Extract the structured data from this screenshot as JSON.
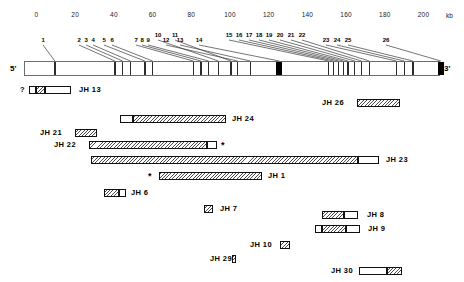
{
  "figure": {
    "unit_label": "kb",
    "five_prime_label": "5'",
    "three_prime_label": "3'"
  },
  "scale": {
    "ticks": [
      0,
      20,
      40,
      60,
      80,
      100,
      120,
      140,
      160,
      180,
      200
    ],
    "min_kb": 0,
    "max_kb": 200,
    "unit": "kb"
  },
  "exons": [
    {
      "id": "1",
      "label": "1",
      "kb": 9.5,
      "type": "line"
    },
    {
      "id": "2",
      "label": "2",
      "kb": 40.5,
      "type": "line"
    },
    {
      "id": "3",
      "label": "3",
      "kb": 44.5,
      "type": "line"
    },
    {
      "id": "4",
      "label": "4",
      "kb": 48.5,
      "type": "line"
    },
    {
      "id": "5",
      "label": "5",
      "kb": 56.0,
      "type": "line"
    },
    {
      "id": "6",
      "label": "6",
      "kb": 60.0,
      "type": "line"
    },
    {
      "id": "7",
      "label": "7",
      "kb": 81.0,
      "type": "line"
    },
    {
      "id": "8",
      "label": "8",
      "kb": 85.0,
      "type": "line"
    },
    {
      "id": "9",
      "label": "9",
      "kb": 89.0,
      "type": "line"
    },
    {
      "id": "10",
      "label": "10",
      "kb": 94.0,
      "type": "line"
    },
    {
      "id": "11",
      "label": "11",
      "kb": 100.5,
      "type": "line"
    },
    {
      "id": "12",
      "label": "12",
      "kb": 104.0,
      "type": "line"
    },
    {
      "id": "13",
      "label": "13",
      "kb": 110.5,
      "type": "line"
    },
    {
      "id": "14",
      "label": "14",
      "kb": 125.5,
      "type": "box"
    },
    {
      "id": "15",
      "label": "15",
      "kb": 151.0,
      "type": "line"
    },
    {
      "id": "16",
      "label": "16",
      "kb": 153.5,
      "type": "line"
    },
    {
      "id": "17",
      "label": "17",
      "kb": 156.0,
      "type": "line"
    },
    {
      "id": "18",
      "label": "18",
      "kb": 158.5,
      "type": "line"
    },
    {
      "id": "19",
      "label": "19",
      "kb": 161.0,
      "type": "line"
    },
    {
      "id": "20",
      "label": "20",
      "kb": 164.5,
      "type": "line"
    },
    {
      "id": "21",
      "label": "21",
      "kb": 168.0,
      "type": "line"
    },
    {
      "id": "22",
      "label": "22",
      "kb": 172.0,
      "type": "line"
    },
    {
      "id": "23",
      "label": "23",
      "kb": 186.0,
      "type": "line"
    },
    {
      "id": "24",
      "label": "24",
      "kb": 190.0,
      "type": "line"
    },
    {
      "id": "25",
      "label": "25",
      "kb": 194.5,
      "type": "line"
    },
    {
      "id": "26",
      "label": "26",
      "kb": 209.0,
      "type": "box"
    }
  ],
  "clones": [
    {
      "name": "JH 13",
      "row": 0,
      "label_side": "right",
      "prefix": "?",
      "segments": [
        {
          "fill": "white",
          "x": 29,
          "w": 7
        },
        {
          "fill": "hatch",
          "x": 36,
          "w": 9
        },
        {
          "fill": "white",
          "x": 45,
          "w": 26
        }
      ],
      "label_x": 79,
      "label_y": 87
    },
    {
      "name": "JH 26",
      "row": 1,
      "label_side": "left",
      "segments": [
        {
          "fill": "hatch",
          "x": 357,
          "w": 43
        }
      ],
      "label_x": 322,
      "label_y": 100
    },
    {
      "name": "JH 24",
      "row": 2,
      "label_side": "right",
      "segments": [
        {
          "fill": "white",
          "x": 120,
          "w": 13
        },
        {
          "fill": "hatch",
          "x": 133,
          "w": 93
        }
      ],
      "label_x": 232,
      "label_y": 116
    },
    {
      "name": "JH 21",
      "row": 3,
      "label_side": "left",
      "segments": [
        {
          "fill": "hatch",
          "x": 75,
          "w": 22
        }
      ],
      "label_x": 40,
      "label_y": 130
    },
    {
      "name": "JH 22",
      "row": 4,
      "label_side": "left",
      "suffix": "*",
      "segments": [
        {
          "fill": "hatch",
          "x": 89,
          "w": 118
        },
        {
          "fill": "white",
          "x": 207,
          "w": 10
        }
      ],
      "label_x": 54,
      "label_y": 142
    },
    {
      "name": "JH 23",
      "row": 5,
      "label_side": "right",
      "segments": [
        {
          "fill": "hatch",
          "x": 91,
          "w": 267
        },
        {
          "fill": "white",
          "x": 358,
          "w": 21
        }
      ],
      "label_x": 386,
      "label_y": 157
    },
    {
      "name": "JH 1",
      "row": 6,
      "label_side": "right",
      "prefix": "*",
      "segments": [
        {
          "fill": "hatch",
          "x": 159,
          "w": 103
        }
      ],
      "label_x": 268,
      "label_y": 173
    },
    {
      "name": "JH 6",
      "row": 7,
      "label_side": "right",
      "segments": [
        {
          "fill": "hatch",
          "x": 104,
          "w": 15
        },
        {
          "fill": "white",
          "x": 119,
          "w": 7
        }
      ],
      "label_x": 131,
      "label_y": 190
    },
    {
      "name": "JH 7",
      "row": 8,
      "label_side": "right",
      "segments": [
        {
          "fill": "hatch",
          "x": 204,
          "w": 9
        }
      ],
      "label_x": 220,
      "label_y": 206
    },
    {
      "name": "JH 8",
      "row": 9,
      "label_side": "right",
      "segments": [
        {
          "fill": "hatch",
          "x": 322,
          "w": 22
        },
        {
          "fill": "white",
          "x": 344,
          "w": 14
        }
      ],
      "label_x": 367,
      "label_y": 212
    },
    {
      "name": "JH 9",
      "row": 10,
      "label_side": "right",
      "segments": [
        {
          "fill": "white",
          "x": 315,
          "w": 7
        },
        {
          "fill": "hatch",
          "x": 322,
          "w": 24
        },
        {
          "fill": "white",
          "x": 346,
          "w": 14
        }
      ],
      "label_x": 368,
      "label_y": 226
    },
    {
      "name": "JH 10",
      "row": 11,
      "label_side": "left",
      "segments": [
        {
          "fill": "hatch",
          "x": 280,
          "w": 10
        }
      ],
      "label_x": 250,
      "label_y": 242
    },
    {
      "name": "JH 29",
      "row": 12,
      "label_side": "left",
      "segments": [
        {
          "fill": "hatch",
          "x": 232,
          "w": 4
        }
      ],
      "label_x": 210,
      "label_y": 256
    },
    {
      "name": "JH 30",
      "row": 13,
      "label_side": "left",
      "segments": [
        {
          "fill": "white",
          "x": 359,
          "w": 28
        },
        {
          "fill": "hatch",
          "x": 387,
          "w": 15
        }
      ],
      "label_x": 331,
      "label_y": 268
    }
  ]
}
